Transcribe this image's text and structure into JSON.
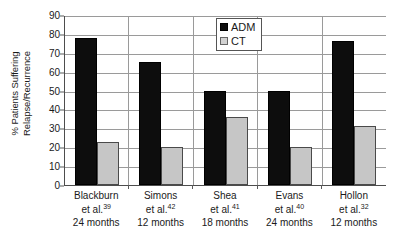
{
  "chart_data": {
    "type": "bar",
    "title": "",
    "xlabel": "",
    "ylabel": "% Patients Suffering Relapse/Recurrence",
    "ylabel_lines": [
      "% Patients Suffering",
      "Relapse/Recurrence"
    ],
    "ylim": [
      0,
      90
    ],
    "ytick_step": 10,
    "yticks": [
      90,
      80,
      70,
      60,
      50,
      40,
      30,
      20,
      10,
      0
    ],
    "grid": true,
    "grid_axis": "both",
    "legend_position": "top-center-right",
    "categories": [
      "Blackburn et al.39 24 months",
      "Simons et al.42 12 months",
      "Shea et al.41 18 months",
      "Evans et al.40 24 months",
      "Hollon et al.32 12 months"
    ],
    "category_labels": [
      {
        "name": "Blackburn",
        "citation": "et al.",
        "ref": "39",
        "duration": "24 months"
      },
      {
        "name": "Simons",
        "citation": "et al.",
        "ref": "42",
        "duration": "12 months"
      },
      {
        "name": "Shea",
        "citation": "et al.",
        "ref": "41",
        "duration": "18 months"
      },
      {
        "name": "Evans",
        "citation": "et al.",
        "ref": "40",
        "duration": "24 months"
      },
      {
        "name": "Hollon",
        "citation": "et al.",
        "ref": "32",
        "duration": "12 months"
      }
    ],
    "series": [
      {
        "name": "ADM",
        "color": "#0d0d0d",
        "values": [
          78,
          65,
          50,
          50,
          76
        ]
      },
      {
        "name": "CT",
        "color": "#c6c6c6",
        "values": [
          23,
          20,
          36,
          20,
          31
        ]
      }
    ]
  },
  "legend": {
    "items": [
      {
        "label": "ADM",
        "swatch": "black-square-icon"
      },
      {
        "label": "CT",
        "swatch": "gray-square-icon"
      }
    ]
  }
}
